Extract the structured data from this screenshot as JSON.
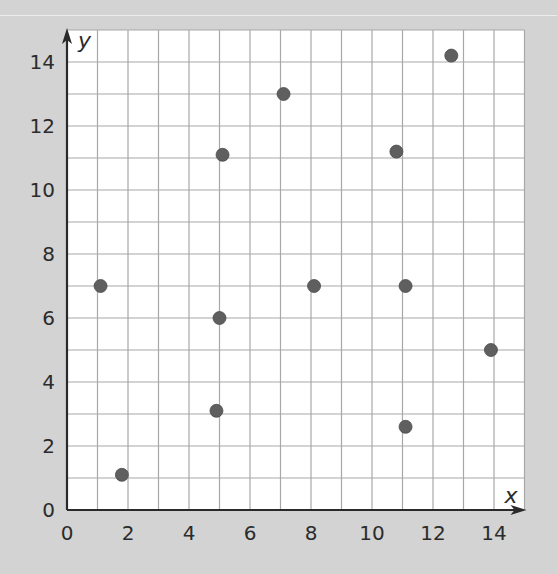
{
  "chart_data": {
    "type": "scatter",
    "title": "",
    "xlabel": "x",
    "ylabel": "y",
    "xlim": [
      0,
      15
    ],
    "ylim": [
      0,
      15
    ],
    "grid": true,
    "grid_step": 1,
    "legend": null,
    "x_ticks": [
      0,
      2,
      4,
      6,
      8,
      10,
      12,
      14
    ],
    "y_ticks": [
      0,
      2,
      4,
      6,
      8,
      10,
      12,
      14
    ],
    "x_tick_labels": [
      "0",
      "2",
      "4",
      "6",
      "8",
      "10",
      "12",
      "14"
    ],
    "y_tick_labels": [
      "0",
      "2",
      "4",
      "6",
      "8",
      "10",
      "12",
      "14"
    ],
    "points": [
      {
        "x": 1.1,
        "y": 7
      },
      {
        "x": 1.8,
        "y": 1.1
      },
      {
        "x": 4.9,
        "y": 3.1
      },
      {
        "x": 5,
        "y": 6
      },
      {
        "x": 5.1,
        "y": 11.1
      },
      {
        "x": 7.1,
        "y": 13
      },
      {
        "x": 8.1,
        "y": 7
      },
      {
        "x": 10.8,
        "y": 11.2
      },
      {
        "x": 11.1,
        "y": 7
      },
      {
        "x": 11.1,
        "y": 2.6
      },
      {
        "x": 12.6,
        "y": 14.2
      },
      {
        "x": 13.9,
        "y": 5
      }
    ],
    "point_color": "#5f5f5f"
  },
  "colors": {
    "background": "#d3d3d3",
    "plot_background": "#ffffff",
    "grid": "#a8a8a8",
    "axis": "#2a2a2a",
    "text": "#2b2b2b"
  }
}
